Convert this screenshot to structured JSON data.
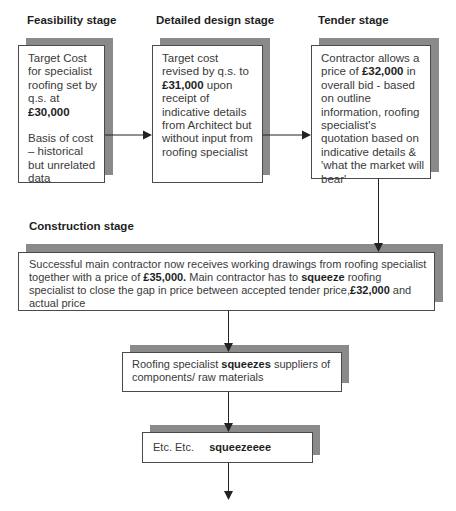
{
  "stages": {
    "feasibility": {
      "label": "Feasibility stage",
      "text_1": "Target Cost for specialist roofing set by q.s. at",
      "amount": "£30,000",
      "text_2": "Basis of cost – historical but unrelated data"
    },
    "detailed_design": {
      "label": "Detailed design stage",
      "text_1": "Target cost revised by q.s. to",
      "amount": "£31,000",
      "text_2": "upon receipt of indicative details from Architect but without input from roofing specialist"
    },
    "tender": {
      "label": "Tender stage",
      "text_1": "Contractor allows a price of",
      "amount": "£32,000",
      "text_2": "in overall bid - based on outline information, roofing specialist's quotation based on indicative details & 'what the market will bear'"
    },
    "construction": {
      "label": "Construction stage",
      "text_1": "Successful main contractor now receives working drawings from roofing specialist together with a price of",
      "amount_1": "£35,000.",
      "text_2": "Main contractor has to",
      "emphasis": "squeeze",
      "text_3": "roofing specialist to close the gap in price between accepted tender price,",
      "amount_2": "£32,000",
      "text_4": "and actual price"
    }
  },
  "roofing_box": {
    "text_1": "Roofing specialist",
    "emphasis": "squeezes",
    "text_2": "suppliers of components/ raw materials"
  },
  "etc_box": {
    "text_1": "Etc. Etc.",
    "emphasis": "squeezeeee"
  },
  "colors": {
    "shadow": "#8a8a8a",
    "border": "#4a4a4a",
    "arrow": "#222222"
  }
}
